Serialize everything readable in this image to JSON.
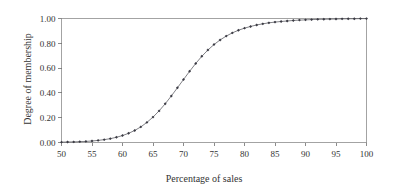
{
  "chart_data": {
    "type": "line",
    "title": "",
    "subtitle": "",
    "xlabel": "Percentage of sales",
    "ylabel": "Degree of membership",
    "xlim": [
      50,
      100
    ],
    "ylim": [
      0.0,
      1.0
    ],
    "xticks": [
      50,
      55,
      60,
      65,
      70,
      75,
      80,
      85,
      90,
      95,
      100
    ],
    "xtick_labels": [
      "50",
      "55",
      "60",
      "65",
      "70",
      "75",
      "80",
      "85",
      "90",
      "95",
      "100"
    ],
    "yticks": [
      0.0,
      0.2,
      0.4,
      0.6,
      0.8,
      1.0
    ],
    "ytick_labels": [
      "0.00",
      "0.20",
      "0.40",
      "0.60",
      "0.80",
      "1.00"
    ],
    "grid": false,
    "legend": null,
    "marker": "diamond",
    "line_color": "#4a4a52",
    "marker_color": "#3b3b44",
    "frame_color": "#8c8c8c",
    "series": [
      {
        "name": "membership",
        "x": [
          50,
          51,
          52,
          53,
          54,
          55,
          56,
          57,
          58,
          59,
          60,
          61,
          62,
          63,
          64,
          65,
          66,
          67,
          68,
          69,
          70,
          71,
          72,
          73,
          74,
          75,
          76,
          77,
          78,
          79,
          80,
          81,
          82,
          83,
          84,
          85,
          86,
          87,
          88,
          89,
          90,
          91,
          92,
          93,
          94,
          95,
          96,
          97,
          98,
          99,
          100
        ],
        "values": [
          0.003,
          0.004,
          0.005,
          0.007,
          0.009,
          0.012,
          0.017,
          0.023,
          0.031,
          0.042,
          0.056,
          0.074,
          0.097,
          0.126,
          0.162,
          0.205,
          0.255,
          0.312,
          0.375,
          0.441,
          0.508,
          0.574,
          0.637,
          0.695,
          0.746,
          0.79,
          0.827,
          0.858,
          0.884,
          0.905,
          0.922,
          0.936,
          0.948,
          0.957,
          0.965,
          0.971,
          0.976,
          0.98,
          0.984,
          0.987,
          0.989,
          0.991,
          0.993,
          0.994,
          0.995,
          0.996,
          0.997,
          0.998,
          0.998,
          0.999,
          0.999
        ]
      }
    ]
  },
  "axes": {
    "x_title": "Percentage of sales",
    "y_title": "Degree of membership"
  }
}
